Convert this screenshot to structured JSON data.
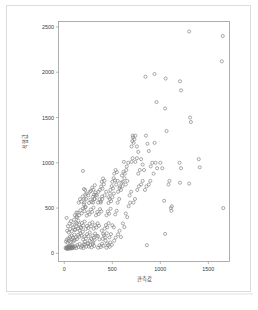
{
  "figure": {
    "background_color": "#ffffff",
    "frame_color": "#dcdcdc",
    "axis_color": "#8c8c8c",
    "marker_color": "#7d7d7d",
    "text_color": "#3a3a3a"
  },
  "chart_data": {
    "type": "scatter",
    "title": "",
    "xlabel": "관측값",
    "ylabel": "적합값",
    "xlim": [
      -60,
      1720
    ],
    "ylim": [
      -90,
      2560
    ],
    "xticks": [
      0,
      500,
      1000,
      1500
    ],
    "yticks": [
      0,
      500,
      1000,
      1500,
      2000,
      2500
    ],
    "xtick_labels": [
      "0",
      "500",
      "1000",
      "1500"
    ],
    "ytick_labels": [
      "0",
      "500",
      "1000",
      "1500",
      "2000",
      "2500"
    ],
    "grid": false,
    "legend": false,
    "marker": "open-circle",
    "marker_size": 3.1,
    "n_points": 249,
    "points": [
      [
        14,
        60
      ],
      [
        20,
        52
      ],
      [
        24,
        70
      ],
      [
        28,
        58
      ],
      [
        33,
        64
      ],
      [
        36,
        48
      ],
      [
        40,
        72
      ],
      [
        44,
        55
      ],
      [
        48,
        80
      ],
      [
        52,
        62
      ],
      [
        56,
        68
      ],
      [
        60,
        52
      ],
      [
        64,
        88
      ],
      [
        68,
        60
      ],
      [
        72,
        74
      ],
      [
        76,
        56
      ],
      [
        80,
        96
      ],
      [
        84,
        66
      ],
      [
        88,
        58
      ],
      [
        92,
        78
      ],
      [
        18,
        130
      ],
      [
        26,
        150
      ],
      [
        34,
        118
      ],
      [
        42,
        165
      ],
      [
        50,
        140
      ],
      [
        58,
        182
      ],
      [
        66,
        128
      ],
      [
        74,
        196
      ],
      [
        82,
        152
      ],
      [
        90,
        170
      ],
      [
        98,
        136
      ],
      [
        106,
        205
      ],
      [
        30,
        250
      ],
      [
        46,
        232
      ],
      [
        62,
        268
      ],
      [
        78,
        244
      ],
      [
        94,
        288
      ],
      [
        110,
        258
      ],
      [
        24,
        392
      ],
      [
        38,
        300
      ],
      [
        54,
        330
      ],
      [
        70,
        356
      ],
      [
        86,
        312
      ],
      [
        102,
        372
      ],
      [
        118,
        340
      ],
      [
        134,
        398
      ],
      [
        100,
        62
      ],
      [
        112,
        78
      ],
      [
        124,
        58
      ],
      [
        136,
        92
      ],
      [
        148,
        70
      ],
      [
        160,
        104
      ],
      [
        108,
        146
      ],
      [
        120,
        178
      ],
      [
        132,
        158
      ],
      [
        144,
        204
      ],
      [
        156,
        186
      ],
      [
        168,
        222
      ],
      [
        180,
        196
      ],
      [
        192,
        238
      ],
      [
        114,
        262
      ],
      [
        128,
        296
      ],
      [
        142,
        274
      ],
      [
        156,
        318
      ],
      [
        170,
        290
      ],
      [
        184,
        336
      ],
      [
        198,
        308
      ],
      [
        212,
        352
      ],
      [
        126,
        404
      ],
      [
        140,
        448
      ],
      [
        154,
        420
      ],
      [
        168,
        476
      ],
      [
        182,
        442
      ],
      [
        196,
        498
      ],
      [
        210,
        466
      ],
      [
        224,
        512
      ],
      [
        150,
        560
      ],
      [
        164,
        598
      ],
      [
        178,
        572
      ],
      [
        192,
        628
      ],
      [
        206,
        604
      ],
      [
        220,
        650
      ],
      [
        205,
        710
      ],
      [
        218,
        700
      ],
      [
        232,
        660
      ],
      [
        195,
        910
      ],
      [
        205,
        540
      ],
      [
        215,
        506
      ],
      [
        175,
        64
      ],
      [
        188,
        80
      ],
      [
        200,
        58
      ],
      [
        214,
        96
      ],
      [
        228,
        74
      ],
      [
        242,
        110
      ],
      [
        196,
        152
      ],
      [
        210,
        188
      ],
      [
        224,
        164
      ],
      [
        238,
        212
      ],
      [
        252,
        190
      ],
      [
        266,
        232
      ],
      [
        222,
        268
      ],
      [
        236,
        302
      ],
      [
        250,
        280
      ],
      [
        264,
        326
      ],
      [
        278,
        298
      ],
      [
        292,
        342
      ],
      [
        234,
        416
      ],
      [
        248,
        452
      ],
      [
        262,
        430
      ],
      [
        276,
        484
      ],
      [
        290,
        458
      ],
      [
        304,
        504
      ],
      [
        258,
        556
      ],
      [
        272,
        592
      ],
      [
        286,
        570
      ],
      [
        300,
        624
      ],
      [
        314,
        600
      ],
      [
        328,
        646
      ],
      [
        276,
        690
      ],
      [
        290,
        726
      ],
      [
        304,
        704
      ],
      [
        318,
        752
      ],
      [
        310,
        648
      ],
      [
        324,
        672
      ],
      [
        256,
        74
      ],
      [
        270,
        92
      ],
      [
        284,
        66
      ],
      [
        298,
        104
      ],
      [
        312,
        82
      ],
      [
        280,
        158
      ],
      [
        294,
        196
      ],
      [
        308,
        172
      ],
      [
        322,
        218
      ],
      [
        336,
        194
      ],
      [
        306,
        272
      ],
      [
        320,
        310
      ],
      [
        334,
        286
      ],
      [
        348,
        332
      ],
      [
        362,
        304
      ],
      [
        330,
        420
      ],
      [
        344,
        458
      ],
      [
        358,
        434
      ],
      [
        372,
        488
      ],
      [
        386,
        462
      ],
      [
        352,
        560
      ],
      [
        366,
        598
      ],
      [
        380,
        574
      ],
      [
        394,
        628
      ],
      [
        370,
        700
      ],
      [
        384,
        738
      ],
      [
        398,
        714
      ],
      [
        412,
        762
      ],
      [
        390,
        790
      ],
      [
        404,
        826
      ],
      [
        418,
        802
      ],
      [
        352,
        62
      ],
      [
        366,
        88
      ],
      [
        380,
        70
      ],
      [
        394,
        106
      ],
      [
        408,
        84
      ],
      [
        400,
        160
      ],
      [
        414,
        198
      ],
      [
        428,
        176
      ],
      [
        442,
        222
      ],
      [
        420,
        272
      ],
      [
        434,
        312
      ],
      [
        448,
        288
      ],
      [
        462,
        334
      ],
      [
        440,
        420
      ],
      [
        454,
        462
      ],
      [
        468,
        438
      ],
      [
        482,
        492
      ],
      [
        460,
        556
      ],
      [
        474,
        600
      ],
      [
        488,
        576
      ],
      [
        480,
        700
      ],
      [
        494,
        742
      ],
      [
        508,
        718
      ],
      [
        500,
        790
      ],
      [
        514,
        830
      ],
      [
        528,
        806
      ],
      [
        520,
        880
      ],
      [
        534,
        920
      ],
      [
        548,
        896
      ],
      [
        440,
        62
      ],
      [
        456,
        90
      ],
      [
        472,
        72
      ],
      [
        470,
        176
      ],
      [
        486,
        212
      ],
      [
        500,
        310
      ],
      [
        516,
        288
      ],
      [
        530,
        430
      ],
      [
        546,
        470
      ],
      [
        556,
        560
      ],
      [
        572,
        600
      ],
      [
        590,
        700
      ],
      [
        606,
        740
      ],
      [
        610,
        790
      ],
      [
        626,
        830
      ],
      [
        630,
        880
      ],
      [
        646,
        920
      ],
      [
        650,
        960
      ],
      [
        666,
        1000
      ],
      [
        700,
        1180
      ],
      [
        708,
        1240
      ],
      [
        716,
        1280
      ],
      [
        712,
        1300
      ],
      [
        722,
        1220
      ],
      [
        730,
        1260
      ],
      [
        700,
        1010
      ],
      [
        712,
        1050
      ],
      [
        620,
        1010
      ],
      [
        740,
        1300
      ],
      [
        756,
        1180
      ],
      [
        770,
        1120
      ],
      [
        800,
        1040
      ],
      [
        816,
        980
      ],
      [
        830,
        920
      ],
      [
        850,
        1300
      ],
      [
        866,
        1210
      ],
      [
        900,
        960
      ],
      [
        916,
        1000
      ],
      [
        930,
        880
      ],
      [
        950,
        1000
      ],
      [
        966,
        940
      ],
      [
        845,
        1950
      ],
      [
        940,
        1980
      ],
      [
        1055,
        1930
      ],
      [
        1205,
        1900
      ],
      [
        1215,
        1800
      ],
      [
        1300,
        2450
      ],
      [
        1650,
        2400
      ],
      [
        1640,
        2120
      ],
      [
        1310,
        1500
      ],
      [
        1318,
        1450
      ],
      [
        1200,
        1000
      ],
      [
        1215,
        940
      ],
      [
        1400,
        1040
      ],
      [
        1410,
        950
      ],
      [
        1205,
        780
      ],
      [
        1300,
        770
      ],
      [
        1050,
        1600
      ],
      [
        960,
        1670
      ],
      [
        1065,
        1350
      ],
      [
        940,
        1220
      ],
      [
        880,
        1130
      ],
      [
        1000,
        1000
      ],
      [
        1020,
        940
      ],
      [
        1085,
        760
      ],
      [
        1095,
        800
      ],
      [
        1040,
        580
      ],
      [
        1110,
        500
      ],
      [
        1115,
        470
      ],
      [
        1120,
        520
      ],
      [
        1050,
        215
      ],
      [
        860,
        90
      ],
      [
        1655,
        500
      ],
      [
        560,
        210
      ],
      [
        575,
        250
      ],
      [
        590,
        180
      ],
      [
        610,
        330
      ],
      [
        625,
        290
      ],
      [
        640,
        440
      ],
      [
        655,
        400
      ],
      [
        670,
        520
      ],
      [
        686,
        560
      ],
      [
        520,
        140
      ],
      [
        536,
        175
      ],
      [
        480,
        120
      ],
      [
        496,
        95
      ],
      [
        560,
        680
      ],
      [
        575,
        720
      ],
      [
        600,
        860
      ],
      [
        616,
        900
      ],
      [
        640,
        760
      ],
      [
        656,
        800
      ],
      [
        680,
        640
      ],
      [
        696,
        680
      ],
      [
        720,
        560
      ],
      [
        736,
        600
      ],
      [
        760,
        700
      ],
      [
        776,
        740
      ],
      [
        800,
        760
      ],
      [
        816,
        800
      ],
      [
        840,
        700
      ],
      [
        856,
        740
      ],
      [
        880,
        760
      ],
      [
        896,
        800
      ],
      [
        770,
        880
      ],
      [
        786,
        920
      ],
      [
        740,
        1010
      ],
      [
        756,
        1050
      ],
      [
        430,
        140
      ],
      [
        446,
        110
      ],
      [
        390,
        250
      ],
      [
        406,
        215
      ],
      [
        350,
        190
      ],
      [
        366,
        155
      ],
      [
        300,
        120
      ],
      [
        316,
        150
      ],
      [
        250,
        110
      ],
      [
        266,
        140
      ],
      [
        200,
        100
      ],
      [
        216,
        130
      ],
      [
        160,
        250
      ],
      [
        176,
        280
      ],
      [
        130,
        330
      ],
      [
        146,
        360
      ],
      [
        110,
        420
      ],
      [
        126,
        450
      ],
      [
        210,
        560
      ],
      [
        226,
        600
      ],
      [
        250,
        640
      ],
      [
        266,
        680
      ],
      [
        300,
        560
      ],
      [
        316,
        600
      ],
      [
        340,
        640
      ],
      [
        356,
        680
      ],
      [
        380,
        560
      ],
      [
        396,
        600
      ],
      [
        420,
        640
      ],
      [
        436,
        680
      ],
      [
        460,
        620
      ],
      [
        476,
        660
      ],
      [
        500,
        620
      ],
      [
        516,
        660
      ],
      [
        540,
        760
      ],
      [
        556,
        800
      ],
      [
        580,
        740
      ],
      [
        596,
        780
      ]
    ]
  }
}
